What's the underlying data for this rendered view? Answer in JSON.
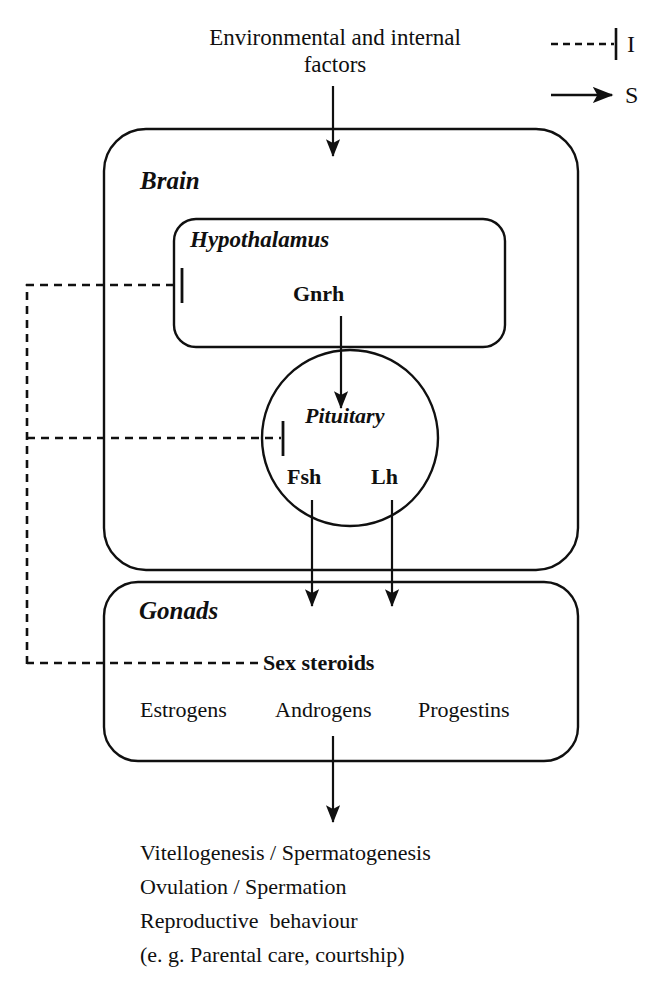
{
  "diagram": {
    "title_text_top": "Environmental and internal\nfactors",
    "legend": {
      "inhibition": {
        "symbol": "dashed-tbar",
        "label": "I"
      },
      "stimulation": {
        "symbol": "solid-arrow",
        "label": "S"
      }
    },
    "boxes": {
      "brain": {
        "label": "Brain"
      },
      "hypothalamus": {
        "label": "Hypothalamus",
        "hormone": "Gnrh"
      },
      "pituitary": {
        "label": "Pituitary",
        "hormone_left": "Fsh",
        "hormone_right": "Lh"
      },
      "gonads": {
        "label": "Gonads",
        "sex_steroids": "Sex steroids",
        "steroid_names": [
          "Estrogens",
          "Androgens",
          "Progestins"
        ]
      }
    },
    "outputs": [
      "Vitellogenesis / Spermatogenesis",
      "Ovulation / Spermation",
      "Reproductive  behaviour",
      "(e. g. Parental care, courtship)"
    ],
    "colors": {
      "stroke": "#101010",
      "background": "#ffffff",
      "text": "#101010"
    }
  }
}
